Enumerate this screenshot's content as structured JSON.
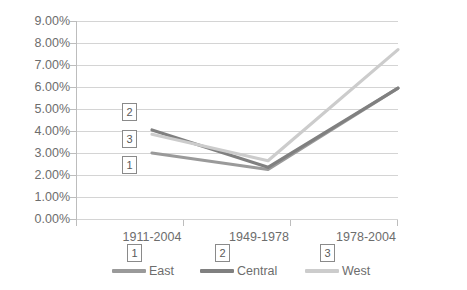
{
  "chart_data": {
    "type": "line",
    "title": "",
    "xlabel": "",
    "ylabel": "",
    "categories": [
      "1911-2004",
      "1949-1978",
      "1978-2004"
    ],
    "series": [
      {
        "name": "East",
        "values": [
          3.0,
          2.25,
          5.95
        ],
        "color": "#9a9a9a",
        "callout": "1"
      },
      {
        "name": "Central",
        "values": [
          4.05,
          2.35,
          5.95
        ],
        "color": "#808080",
        "callout": "2"
      },
      {
        "name": "West",
        "values": [
          3.85,
          2.65,
          7.7
        ],
        "color": "#cccccc",
        "callout": "3"
      }
    ],
    "ylim": [
      0,
      9
    ],
    "ytick_labels": [
      "9.00%",
      "8.00%",
      "7.00%",
      "6.00%",
      "5.00%",
      "4.00%",
      "3.00%",
      "2.00%",
      "1.00%",
      "0.00%"
    ],
    "ytick_values": [
      9,
      8,
      7,
      6,
      5,
      4,
      3,
      2,
      1,
      0
    ],
    "value_suffix": "%",
    "grid": true,
    "legend_position": "bottom"
  },
  "annotations": {
    "plot_callouts": [
      {
        "label": "2",
        "series": "Central"
      },
      {
        "label": "3",
        "series": "West"
      },
      {
        "label": "1",
        "series": "East"
      }
    ]
  },
  "colors": {
    "gridline": "#d4d4d4",
    "axis": "#bdbdbd",
    "text": "#6d6d6d",
    "background": "#ffffff",
    "callout_border": "#8a8a8a"
  }
}
